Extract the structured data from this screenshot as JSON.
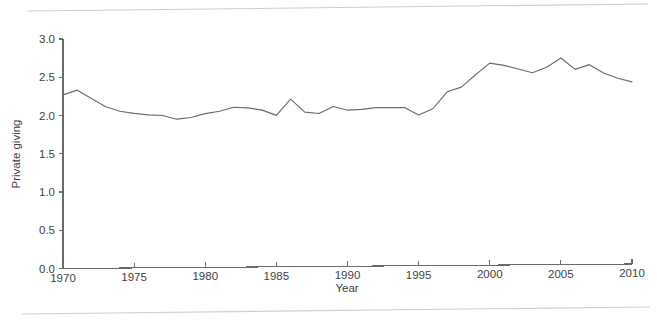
{
  "figure": {
    "background_color": "#ffffff",
    "rule_color": "#c9c9c9",
    "axis_color": "#6b6b6b",
    "text_color": "#3f3f3f"
  },
  "chart_data": {
    "type": "line",
    "title": "",
    "xlabel": "Year",
    "ylabel": "Private giving",
    "xlim": [
      1970,
      2010
    ],
    "ylim": [
      0.0,
      3.0
    ],
    "grid": false,
    "legend": "none",
    "line_color": "#6b6b6b",
    "xticks": [
      1970,
      1975,
      1980,
      1985,
      1990,
      1995,
      2000,
      2005,
      2010
    ],
    "xtick_labels": [
      "1970",
      "1975",
      "1980",
      "1985",
      "1990",
      "1995",
      "2000",
      "2005",
      "2010"
    ],
    "yticks": [
      0.0,
      0.5,
      1.0,
      1.5,
      2.0,
      2.5,
      3.0
    ],
    "ytick_labels": [
      "0.0",
      "0.5",
      "1.0",
      "1.5",
      "2.0",
      "2.5",
      "3.0"
    ],
    "x": [
      1970,
      1971,
      1972,
      1973,
      1974,
      1975,
      1976,
      1977,
      1978,
      1979,
      1980,
      1981,
      1982,
      1983,
      1984,
      1985,
      1986,
      1987,
      1988,
      1989,
      1990,
      1991,
      1992,
      1993,
      1994,
      1995,
      1996,
      1997,
      1998,
      1999,
      2000,
      2001,
      2002,
      2003,
      2004,
      2005,
      2006,
      2007,
      2008,
      2009,
      2010
    ],
    "values": [
      2.27,
      2.33,
      2.22,
      2.11,
      2.05,
      2.02,
      2.0,
      1.99,
      1.94,
      1.96,
      2.01,
      2.04,
      2.09,
      2.08,
      2.05,
      1.98,
      2.19,
      2.02,
      2.0,
      2.09,
      2.04,
      2.05,
      2.07,
      2.07,
      2.07,
      1.97,
      2.05,
      2.27,
      2.33,
      2.49,
      2.64,
      2.61,
      2.56,
      2.51,
      2.58,
      2.7,
      2.55,
      2.61,
      2.5,
      2.43,
      2.38
    ],
    "series": [
      {
        "name": "Private giving",
        "values": [
          2.27,
          2.33,
          2.22,
          2.11,
          2.05,
          2.02,
          2.0,
          1.99,
          1.94,
          1.96,
          2.01,
          2.04,
          2.09,
          2.08,
          2.05,
          1.98,
          2.19,
          2.02,
          2.0,
          2.09,
          2.04,
          2.05,
          2.07,
          2.07,
          2.07,
          1.97,
          2.05,
          2.27,
          2.33,
          2.49,
          2.64,
          2.61,
          2.56,
          2.51,
          2.58,
          2.7,
          2.55,
          2.61,
          2.5,
          2.43,
          2.38
        ]
      }
    ]
  }
}
